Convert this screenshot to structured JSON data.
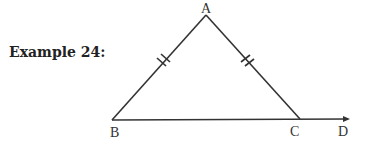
{
  "title": "Example 24:",
  "diagram": {
    "type": "isosceles-triangle",
    "vertices": {
      "A": "A",
      "B": "B",
      "C": "C"
    },
    "extension_point": "D",
    "congruent_sides": [
      "AB",
      "AC"
    ],
    "tick_marks": "double",
    "ray": "BC extended to D"
  }
}
